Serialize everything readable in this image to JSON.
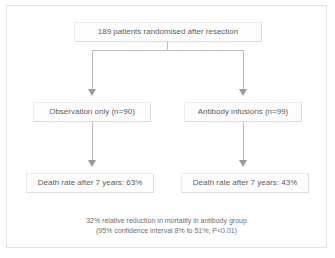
{
  "figure": {
    "type": "flowchart"
  },
  "nodes": {
    "enrolment": {
      "label": "189 patients randomised after resection",
      "total_patients": 189
    },
    "arm_control": {
      "label": "Observation only (n=90)",
      "name": "Observation only",
      "n": 90
    },
    "arm_treatment": {
      "label": "Antibody infusions (n=99)",
      "name": "Antibody infusions",
      "n": 99
    },
    "outcome_control": {
      "label": "Death rate after 7 years: 63%",
      "outcome": "Death rate after 7 years",
      "value": "63%"
    },
    "outcome_treatment": {
      "label": "Death rate after 7 years: 43%",
      "outcome": "Death rate after 7 years",
      "value": "43%"
    }
  },
  "footnote": {
    "line1": "32% relative reduction in mortality in antibody group",
    "line2": "(95% confidence interval 8% to 51%; P<0.01)",
    "relative_reduction": "32%",
    "ci_lower": "8%",
    "ci_upper": "51%",
    "p_value": "P<0.01"
  },
  "colors": {
    "frame_border": "#e2e2e2",
    "box_border": "#dcdcdc",
    "box_fill": "#fdfdfd",
    "connector": "#bdbdbd",
    "arrowhead": "#9a9a9a",
    "text": "#5e5e5e",
    "footnote_text": "#6e6e6e",
    "background": "#ffffff"
  }
}
